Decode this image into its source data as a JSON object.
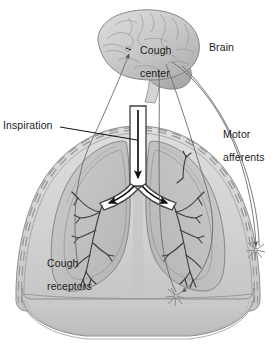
{
  "figure": {
    "background_color": "#ffffff"
  },
  "labels": {
    "brain": "Brain",
    "cough_center_line1": "Cough",
    "cough_center_line2": "center",
    "inspiration": "Inspiration",
    "motor_afferents_line1": "Motor",
    "motor_afferents_line2": "afferents",
    "cough_receptors_line1": "Cough",
    "cough_receptors_line2": "receptors"
  },
  "anatomy": {
    "parts": [
      "brain",
      "cerebellum",
      "brainstem",
      "trachea",
      "left-main-bronchus",
      "right-main-bronchus",
      "bronchial-tree",
      "left-lung",
      "right-lung",
      "rib-cage",
      "diaphragm",
      "pleura"
    ]
  },
  "pathways": {
    "sensory_afferent": {
      "name": "sensory-afferent-nerve",
      "from": "cough receptors in airways",
      "to": "cough center",
      "arrow_direction": "up"
    },
    "motor_efferent_intercostal": {
      "name": "motor-efferent-intercostal",
      "from": "cough center",
      "to": "intercostal muscle nerve ending",
      "arrow_direction": "down"
    },
    "motor_efferent_diaphragm": {
      "name": "motor-efferent-diaphragm",
      "from": "cough center",
      "to": "diaphragm nerve ending",
      "arrow_direction": "down"
    },
    "inspiratory_airflow": {
      "name": "inspiratory-airflow-arrow",
      "description": "airflow down trachea splitting into both main bronchi",
      "arrow_direction": "down and branching"
    }
  },
  "nerve_endings": [
    {
      "name": "nerve-ending-intercostal",
      "x": 256,
      "y": 250
    },
    {
      "name": "nerve-ending-diaphragm",
      "x": 176,
      "y": 296
    }
  ],
  "colors": {
    "outline": "#5a5a5a",
    "dark_outline": "#3c3c3c",
    "lung_fill": "#c9c9c9",
    "lung_fill_dark": "#b3b3b3",
    "thorax_fill": "#d6d6d6",
    "brain_fill": "#cfcfcf",
    "brain_fill_dark": "#b0b0b0",
    "rib_dash": "#9a9a9a",
    "airway_fill": "#ffffff",
    "arrow_black": "#111111",
    "label_text": "#1b1b1b",
    "nerve_line": "#6b6b6b"
  }
}
